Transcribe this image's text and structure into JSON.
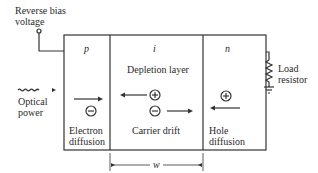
{
  "diagram": {
    "type": "p-i-n photodiode schematic",
    "labels": {
      "bias_line1": "Reverse bias",
      "bias_line2": "voltage",
      "optical_line1": "Optical",
      "optical_line2": "power",
      "load_line1": "Load",
      "load_line2": "resistor",
      "width": "w"
    },
    "regions": [
      {
        "id": "p",
        "label": "p",
        "caption_line1": "Electron",
        "caption_line2": "diffusion",
        "carrier": "−",
        "arrow": "right"
      },
      {
        "id": "i",
        "label": "i",
        "subtitle": "Depletion layer",
        "caption": "Carrier drift",
        "carriers": [
          "+",
          "−"
        ],
        "arrows": [
          "left",
          "right"
        ]
      },
      {
        "id": "n",
        "label": "n",
        "caption_line1": "Hole",
        "caption_line2": "diffusion",
        "carrier": "+",
        "arrow": "left"
      }
    ],
    "colors": {
      "line": "#333333",
      "background": "#ffffff"
    }
  }
}
